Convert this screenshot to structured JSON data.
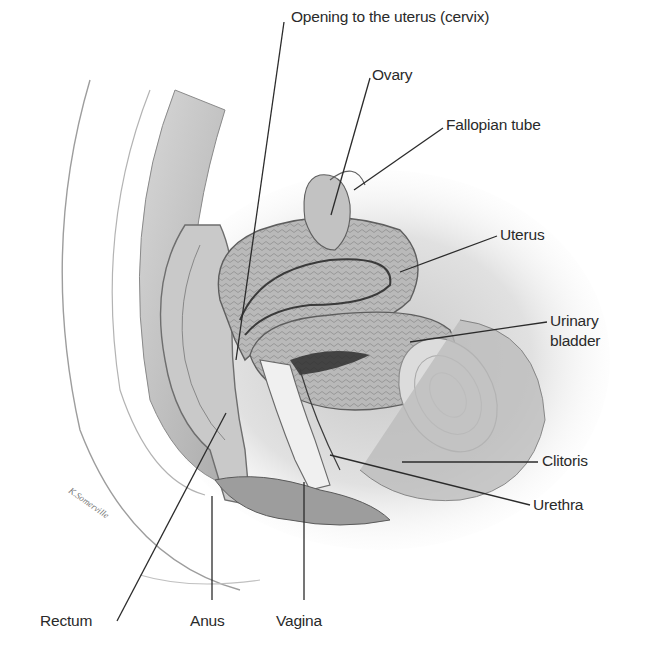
{
  "figure": {
    "artist_signature": "K. Somerville",
    "labels": {
      "cervix": "Opening to the uterus (cervix)",
      "ovary": "Ovary",
      "fallopian_tube": "Fallopian tube",
      "uterus": "Uterus",
      "urinary_bladder_line1": "Urinary",
      "urinary_bladder_line2": "bladder",
      "clitoris": "Clitoris",
      "urethra": "Urethra",
      "rectum": "Rectum",
      "anus": "Anus",
      "vagina": "Vagina"
    }
  }
}
